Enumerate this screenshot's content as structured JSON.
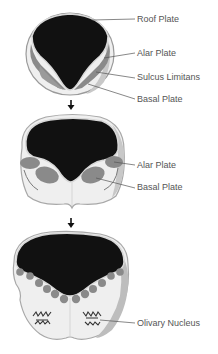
{
  "colors": {
    "cavity": "#111111",
    "plate_gray": "#8a8a8a",
    "tissue": "#efefef",
    "rim": "#b9b9b9",
    "leader": "#555555",
    "label_text": "#555555",
    "arrow": "#111111"
  },
  "stages": [
    {
      "name": "neural-tube-stage",
      "labels": [
        {
          "text": "Roof Plate"
        },
        {
          "text": "Alar Plate"
        },
        {
          "text": "Sulcus Limitans"
        },
        {
          "text": "Basal Plate"
        }
      ]
    },
    {
      "name": "intermediate-stage",
      "labels": [
        {
          "text": "Alar Plate"
        },
        {
          "text": "Basal Plate"
        }
      ]
    },
    {
      "name": "medulla-stage",
      "labels": [
        {
          "text": "Olivary Nucleus"
        }
      ]
    }
  ],
  "arrows": [
    {
      "icon": "arrow-down-icon"
    },
    {
      "icon": "arrow-down-icon"
    }
  ]
}
